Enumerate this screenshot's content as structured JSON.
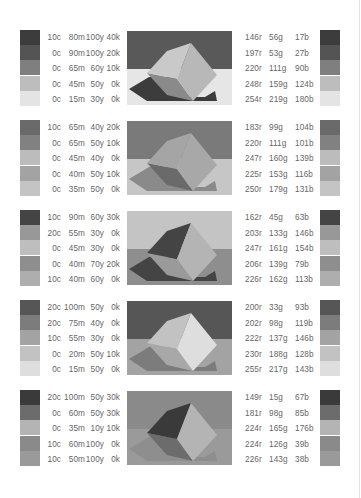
{
  "palettes": [
    {
      "cmyk": [
        {
          "c": "10c",
          "m": "80m",
          "y": "100y",
          "k": "40k"
        },
        {
          "c": "0c",
          "m": "90m",
          "y": "100y",
          "k": "20k"
        },
        {
          "c": "0c",
          "m": "65m",
          "y": "60y",
          "k": "10k"
        },
        {
          "c": "0c",
          "m": "45m",
          "y": "50y",
          "k": "0k"
        },
        {
          "c": "0c",
          "m": "15m",
          "y": "30y",
          "k": "0k"
        }
      ],
      "rgb": [
        {
          "r": "146r",
          "g": "56g",
          "b": "17b"
        },
        {
          "r": "197r",
          "g": "53g",
          "b": "27b"
        },
        {
          "r": "220r",
          "g": "111g",
          "b": "90b"
        },
        {
          "r": "248r",
          "g": "159g",
          "b": "124b"
        },
        {
          "r": "254r",
          "g": "219g",
          "b": "180b"
        }
      ],
      "swatch_colors": [
        "#3c3c3c",
        "#545454",
        "#7f7f7f",
        "#bdbdbd",
        "#e4e4e4"
      ],
      "cube": {
        "bg_top": "#595959",
        "bg_bottom": "#e6e6e6",
        "shadow": "#3c3c3c",
        "face_left": "#8a8a8a",
        "face_top": "#c9c9c9",
        "face_right": "#b8b8b8"
      }
    },
    {
      "cmyk": [
        {
          "c": "10c",
          "m": "65m",
          "y": "40y",
          "k": "20k"
        },
        {
          "c": "0c",
          "m": "65m",
          "y": "50y",
          "k": "10k"
        },
        {
          "c": "0c",
          "m": "45m",
          "y": "40y",
          "k": "0k"
        },
        {
          "c": "0c",
          "m": "40m",
          "y": "50y",
          "k": "10k"
        },
        {
          "c": "0c",
          "m": "35m",
          "y": "50y",
          "k": "0k"
        }
      ],
      "rgb": [
        {
          "r": "183r",
          "g": "99g",
          "b": "104b"
        },
        {
          "r": "220r",
          "g": "111g",
          "b": "101b"
        },
        {
          "r": "247r",
          "g": "160g",
          "b": "139b"
        },
        {
          "r": "225r",
          "g": "153g",
          "b": "116b"
        },
        {
          "r": "250r",
          "g": "179g",
          "b": "131b"
        }
      ],
      "swatch_colors": [
        "#6a6a6a",
        "#818181",
        "#bcbcbc",
        "#a3a3a3",
        "#c4c4c4"
      ],
      "cube": {
        "bg_top": "#7a7a7a",
        "bg_bottom": "#c6c6c6",
        "shadow": "#8a8a8a",
        "face_left": "#6a6a6a",
        "face_top": "#a5a5a5",
        "face_right": "#a8a8a8"
      }
    },
    {
      "cmyk": [
        {
          "c": "10c",
          "m": "90m",
          "y": "60y",
          "k": "30k"
        },
        {
          "c": "20c",
          "m": "55m",
          "y": "30y",
          "k": "0k"
        },
        {
          "c": "0c",
          "m": "45m",
          "y": "30y",
          "k": "0k"
        },
        {
          "c": "0c",
          "m": "40m",
          "y": "70y",
          "k": "20k"
        },
        {
          "c": "10c",
          "m": "40m",
          "y": "60y",
          "k": "0k"
        }
      ],
      "rgb": [
        {
          "r": "162r",
          "g": "45g",
          "b": "63b"
        },
        {
          "r": "203r",
          "g": "133g",
          "b": "146b"
        },
        {
          "r": "247r",
          "g": "161g",
          "b": "154b"
        },
        {
          "r": "206r",
          "g": "139g",
          "b": "79b"
        },
        {
          "r": "226r",
          "g": "162g",
          "b": "113b"
        }
      ],
      "swatch_colors": [
        "#444444",
        "#989898",
        "#bebebe",
        "#8e8e8e",
        "#aeaeae"
      ],
      "cube": {
        "bg_top": "#c4c4c4",
        "bg_bottom": "#8e8e8e",
        "shadow": "#444444",
        "face_left": "#9a9a9a",
        "face_top": "#444444",
        "face_right": "#b4b4b4"
      }
    },
    {
      "cmyk": [
        {
          "c": "20c",
          "m": "100m",
          "y": "50y",
          "k": "0k"
        },
        {
          "c": "20c",
          "m": "75m",
          "y": "40y",
          "k": "0k"
        },
        {
          "c": "10c",
          "m": "55m",
          "y": "30y",
          "k": "0k"
        },
        {
          "c": "0c",
          "m": "20m",
          "y": "50y",
          "k": "10k"
        },
        {
          "c": "0c",
          "m": "15m",
          "y": "50y",
          "k": "0k"
        }
      ],
      "rgb": [
        {
          "r": "200r",
          "g": "33g",
          "b": "93b"
        },
        {
          "r": "202r",
          "g": "98g",
          "b": "119b"
        },
        {
          "r": "222r",
          "g": "137g",
          "b": "146b"
        },
        {
          "r": "230r",
          "g": "188g",
          "b": "128b"
        },
        {
          "r": "255r",
          "g": "217g",
          "b": "143b"
        }
      ],
      "swatch_colors": [
        "#565656",
        "#7c7c7c",
        "#a3a3a3",
        "#c2c2c2",
        "#dedede"
      ],
      "cube": {
        "bg_top": "#565656",
        "bg_bottom": "#a3a3a3",
        "shadow": "#7c7c7c",
        "face_left": "#a8a8a8",
        "face_top": "#c2c2c2",
        "face_right": "#dedede"
      }
    },
    {
      "cmyk": [
        {
          "c": "20c",
          "m": "100m",
          "y": "50y",
          "k": "30k"
        },
        {
          "c": "0c",
          "m": "60m",
          "y": "50y",
          "k": "30k"
        },
        {
          "c": "0c",
          "m": "35m",
          "y": "10y",
          "k": "10k"
        },
        {
          "c": "10c",
          "m": "60m",
          "y": "100y",
          "k": "0k"
        },
        {
          "c": "10c",
          "m": "50m",
          "y": "100y",
          "k": "0k"
        }
      ],
      "rgb": [
        {
          "r": "149r",
          "g": "15g",
          "b": "67b"
        },
        {
          "r": "181r",
          "g": "98g",
          "b": "85b"
        },
        {
          "r": "224r",
          "g": "165g",
          "b": "176b"
        },
        {
          "r": "224r",
          "g": "126g",
          "b": "39b"
        },
        {
          "r": "226r",
          "g": "143g",
          "b": "38b"
        }
      ],
      "swatch_colors": [
        "#3a3a3a",
        "#6c6c6c",
        "#b4b4b4",
        "#8a8a8a",
        "#9a9a9a"
      ],
      "cube": {
        "bg_top": "#8a8a8a",
        "bg_bottom": "#9a9a9a",
        "shadow": "#8e8e8e",
        "face_left": "#6c6c6c",
        "face_top": "#3a3a3a",
        "face_right": "#b4b4b4"
      }
    }
  ]
}
